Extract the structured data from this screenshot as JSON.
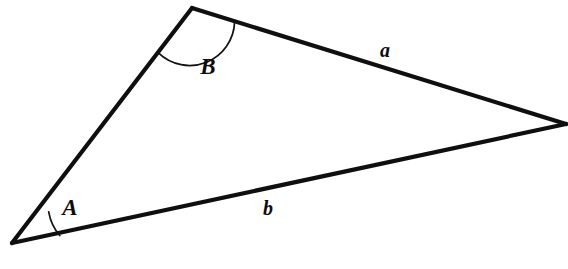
{
  "diagram": {
    "type": "geometry-triangle",
    "canvas": {
      "width": 568,
      "height": 269,
      "background": "#ffffff"
    },
    "stroke_color": "#100f10",
    "arc_color": "#131213",
    "label_color": "#0d0c0d",
    "vertices": [
      {
        "name": "A",
        "x": 12,
        "y": 243
      },
      {
        "name": "B",
        "x": 192,
        "y": 8
      },
      {
        "name": "C",
        "x": 566,
        "y": 124
      }
    ],
    "edges": [
      {
        "name": "edge-AB",
        "from": "A",
        "to": "B",
        "label": null
      },
      {
        "name": "edge-BC",
        "from": "B",
        "to": "C",
        "label": "a"
      },
      {
        "name": "edge-AC",
        "from": "A",
        "to": "C",
        "label": "b"
      }
    ],
    "angles": [
      {
        "name": "angle-A",
        "at": "A",
        "label": "A",
        "arc_radius": 48
      },
      {
        "name": "angle-B",
        "at": "B",
        "label": "B",
        "arc_radius": 45
      }
    ],
    "labels": {
      "angle_a": {
        "text": "A",
        "x": 70,
        "y": 207
      },
      "angle_b": {
        "text": "B",
        "x": 208,
        "y": 66
      },
      "side_a": {
        "text": "a",
        "x": 385,
        "y": 50
      },
      "side_b": {
        "text": "b",
        "x": 268,
        "y": 208
      }
    },
    "paths": {
      "edge_AB": "M 12 243 L 192 8",
      "edge_BC": "M 192 8 L 566 124",
      "edge_AC": "M 12 243 L 566 124",
      "arc_A": "M 48.7 211.9 A 48 48 0 0 0 59.8 235.5",
      "arc_B": "M 158.4 52.9 A 45 45 0 0 0 234.6 21.9"
    }
  }
}
